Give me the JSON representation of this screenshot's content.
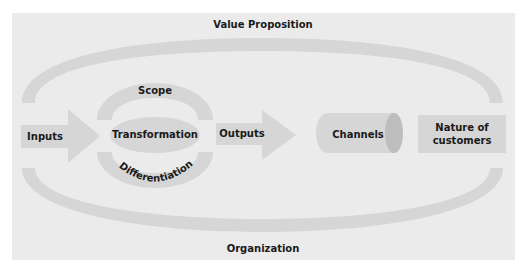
{
  "diagram": {
    "title_top": "Value Proposition",
    "title_bottom": "Organization",
    "nodes": {
      "inputs": "Inputs",
      "transformation": "Transformation",
      "scope": "Scope",
      "differentiation": "Differentiation",
      "outputs": "Outputs",
      "channels": "Channels",
      "nature_line1": "Nature of",
      "nature_line2": "customers"
    },
    "colors": {
      "background": "#ffffff",
      "panel": "#ebebeb",
      "shape": "#d6d6d6",
      "cap": "#bdbdbd",
      "text": "#1a1a1a"
    }
  }
}
